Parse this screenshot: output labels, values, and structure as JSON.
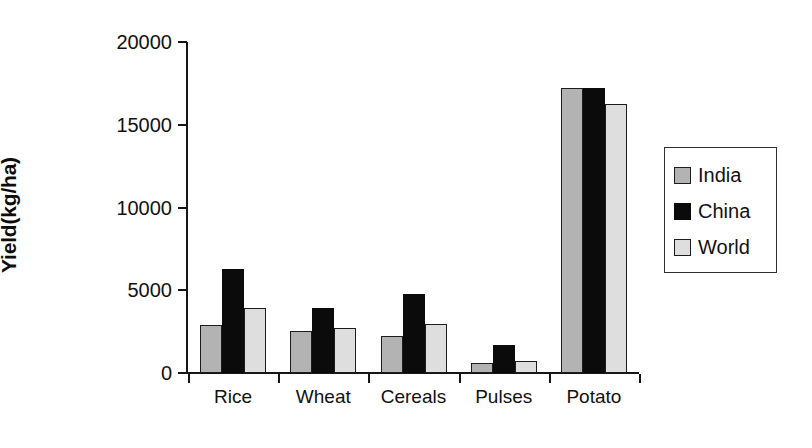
{
  "chart_data": {
    "type": "bar",
    "title": "",
    "xlabel": "",
    "ylabel": "Yield(kg/ha)",
    "categories": [
      "Rice",
      "Wheat",
      "Cereals",
      "Pulses",
      "Potato"
    ],
    "series": [
      {
        "name": "India",
        "color": "#b3b3b3",
        "values": [
          2900,
          2550,
          2250,
          600,
          17200
        ]
      },
      {
        "name": "China",
        "color": "#0b0b0b",
        "values": [
          6300,
          3950,
          4800,
          1700,
          17200
        ]
      },
      {
        "name": "World",
        "color": "#dedede",
        "values": [
          3900,
          2700,
          2950,
          750,
          16250
        ]
      }
    ],
    "ylim": [
      0,
      20000
    ],
    "yticks": [
      0,
      5000,
      10000,
      15000,
      20000
    ],
    "ytick_labels": [
      "0",
      "5000",
      "10000",
      "15000",
      "20000"
    ],
    "grid": false,
    "legend_position": "right"
  }
}
